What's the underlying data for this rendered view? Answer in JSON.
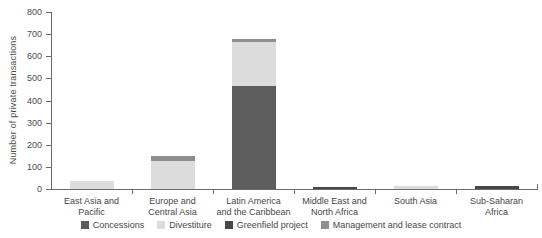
{
  "figure": {
    "background": "#ffffff",
    "axis_color": "#6b6b6b",
    "text_color": "#474747"
  },
  "chart_data": {
    "type": "bar",
    "stacked": true,
    "title": "",
    "xlabel": "",
    "ylabel": "Number of private transactions",
    "ylim": [
      0,
      800
    ],
    "ytick_step": 100,
    "yticks": [
      0,
      100,
      200,
      300,
      400,
      500,
      600,
      700,
      800
    ],
    "grid": false,
    "legend_position": "bottom",
    "categories": [
      {
        "label": "East Asia and Pacific",
        "label_lines": [
          "East Asia and",
          "Pacific"
        ]
      },
      {
        "label": "Europe and Central Asia",
        "label_lines": [
          "Europe and",
          "Central Asia"
        ]
      },
      {
        "label": "Latin America and the Caribbean",
        "label_lines": [
          "Latin America",
          "and the Caribbean"
        ]
      },
      {
        "label": "Middle East and North Africa",
        "label_lines": [
          "Middle East and",
          "North Africa"
        ]
      },
      {
        "label": "South Asia",
        "label_lines": [
          "South Asia"
        ]
      },
      {
        "label": "Sub-Saharan Africa",
        "label_lines": [
          "Sub-Saharan",
          "Africa"
        ]
      }
    ],
    "series": [
      {
        "name": "Concessions",
        "color": "#5d5d5d",
        "values": [
          0,
          0,
          465,
          0,
          0,
          0
        ]
      },
      {
        "name": "Divestiture",
        "color": "#dcdcdc",
        "values": [
          34,
          128,
          200,
          0,
          12,
          0
        ]
      },
      {
        "name": "Greenfield project",
        "color": "#484848",
        "values": [
          0,
          0,
          0,
          8,
          0,
          15
        ]
      },
      {
        "name": "Management and lease contract",
        "color": "#8e8e8e",
        "values": [
          0,
          20,
          15,
          0,
          0,
          0
        ]
      }
    ],
    "totals": [
      34,
      148,
      680,
      8,
      12,
      15
    ]
  }
}
